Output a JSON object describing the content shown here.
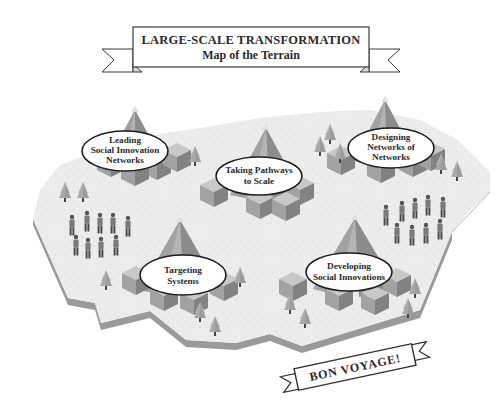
{
  "title_banner": {
    "line1": "LARGE-SCALE TRANSFORMATION",
    "line2": "Map of the Terrain"
  },
  "mountains": [
    {
      "id": "leading",
      "lines": [
        "Leading",
        "Social Innovation",
        "Networks"
      ]
    },
    {
      "id": "pathways",
      "lines": [
        "Taking Pathways",
        "to Scale"
      ]
    },
    {
      "id": "designing",
      "lines": [
        "Designing",
        "Networks of",
        "Networks"
      ]
    },
    {
      "id": "targeting",
      "lines": [
        "Targeting",
        "Systems"
      ]
    },
    {
      "id": "developing",
      "lines": [
        "Developing",
        "Social Innovations"
      ]
    }
  ],
  "footer_banner": {
    "label": "BON VOYAGE!"
  },
  "colors": {
    "ground": "#ececec",
    "ground_edge": "#9a9a9a",
    "mountain_light": "#b9b9b9",
    "mountain_mid": "#9c9c9c",
    "mountain_dark": "#7b7b7b",
    "ink": "#2a2a2a"
  }
}
